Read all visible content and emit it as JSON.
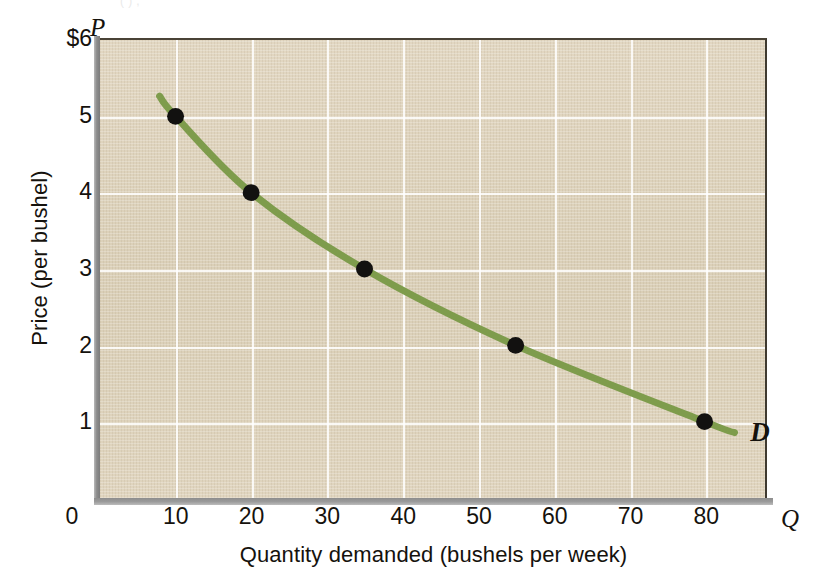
{
  "figure": {
    "top_bleed_text": "(                    )                                      ,",
    "curve_label": "D",
    "price_axis_symbol": "P",
    "quantity_axis_symbol": "Q",
    "colors": {
      "curve": "#7e9c4c",
      "point": "#121110",
      "plot_background": "#ded2bb",
      "gridline": "#ffffff",
      "axis_bar": "#8d8d8d",
      "text": "#15120d"
    }
  },
  "chart_data": {
    "type": "line",
    "title": "",
    "subtitle": "",
    "xlabel": "Quantity demanded (bushels per week)",
    "ylabel": "Price (per bushel)",
    "x_axis_symbol": "Q",
    "y_axis_symbol": "P",
    "xlim": [
      0,
      88
    ],
    "ylim": [
      0,
      6
    ],
    "xticks": [
      0,
      10,
      20,
      30,
      40,
      50,
      60,
      70,
      80
    ],
    "xtick_labels": [
      "0",
      "10",
      "20",
      "30",
      "40",
      "50",
      "60",
      "70",
      "80"
    ],
    "yticks": [
      1,
      2,
      3,
      4,
      5,
      6
    ],
    "ytick_labels": [
      "1",
      "2",
      "3",
      "4",
      "5",
      "$6"
    ],
    "grid": true,
    "legend": "none",
    "series": [
      {
        "name": "D",
        "label": "D",
        "color": "#7e9c4c",
        "marker": "circle",
        "x": [
          10,
          20,
          35,
          55,
          80
        ],
        "y": [
          5,
          4,
          3,
          2,
          1
        ],
        "points": [
          {
            "quantity": 10,
            "price": 5
          },
          {
            "quantity": 20,
            "price": 4
          },
          {
            "quantity": 35,
            "price": 3
          },
          {
            "quantity": 55,
            "price": 2
          },
          {
            "quantity": 80,
            "price": 1
          }
        ]
      }
    ],
    "annotations": [
      {
        "text": "D",
        "x": 85,
        "y": 0.82,
        "style": "bold-italic"
      }
    ]
  }
}
